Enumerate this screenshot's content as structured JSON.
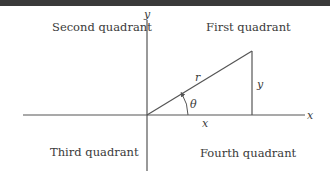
{
  "diagram": {
    "quadrants": {
      "first": "First quadrant",
      "second": "Second quadrant",
      "third": "Third quadrant",
      "fourth": "Fourth quadrant"
    },
    "axes": {
      "x_label": "x",
      "y_label": "y"
    },
    "triangle": {
      "hypotenuse_label": "r",
      "opposite_label": "y",
      "adjacent_label": "x",
      "angle_label": "θ"
    },
    "colors": {
      "line": "#555555",
      "text": "#3a3a3a",
      "top_bar": "#3a3a3a"
    }
  }
}
